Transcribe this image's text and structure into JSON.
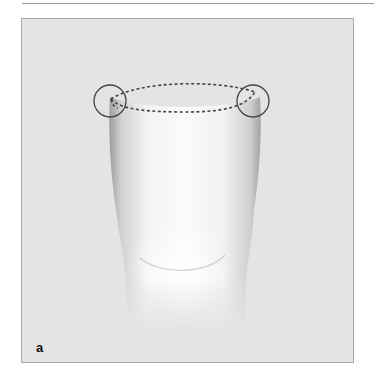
{
  "figure": {
    "panel_label": "a",
    "annotations": [
      {
        "type": "circle",
        "name": "left-margin-circle"
      },
      {
        "type": "circle",
        "name": "right-margin-circle"
      },
      {
        "type": "dashed-outline",
        "name": "occlusal-outline"
      }
    ],
    "colors": {
      "panel_background": "#e4e4e4",
      "panel_border": "#a9a9a9",
      "annotation_stroke": "#444444",
      "tooth_highlight": "#ffffff"
    }
  }
}
